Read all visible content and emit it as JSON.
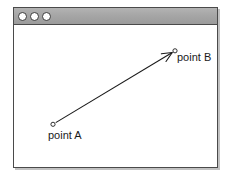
{
  "window": {
    "titlebar": {
      "controls": [
        {
          "name": "window-control-close",
          "color": "#ffffff"
        },
        {
          "name": "window-control-minimize",
          "color": "#ffffff"
        },
        {
          "name": "window-control-maximize",
          "color": "#ffffff"
        }
      ],
      "background_color": "#a6a6a6",
      "border_color": "#4a4a4a"
    },
    "canvas": {
      "background_color": "#ffffff"
    }
  },
  "diagram": {
    "type": "arrow-between-two-points",
    "stroke_color": "#1a1a1a",
    "points": [
      {
        "id": "a",
        "label": "point A",
        "marker": "open-circle",
        "x": 39,
        "y": 100
      },
      {
        "id": "b",
        "label": "point B",
        "marker": "open-circle",
        "x": 161,
        "y": 26
      }
    ],
    "arrow": {
      "from": "a",
      "to": "b",
      "head": "at-end",
      "head_style": "open-v"
    }
  }
}
